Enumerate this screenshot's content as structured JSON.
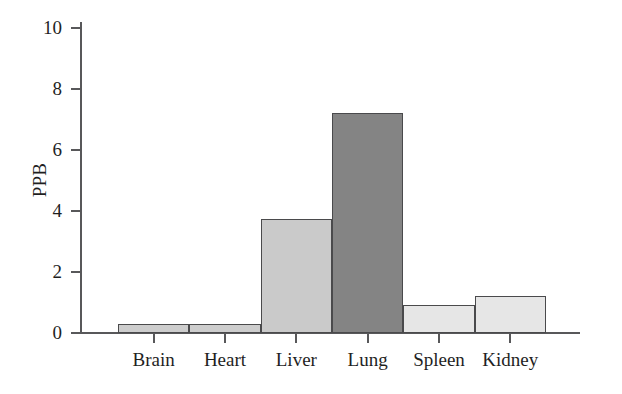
{
  "chart_data": {
    "type": "bar",
    "title": "",
    "subtitle": "",
    "xlabel": "",
    "ylabel": "PPB",
    "categories": [
      "Brain",
      "Heart",
      "Liver",
      "Lung",
      "Spleen",
      "Kidney"
    ],
    "values": [
      0.3,
      0.28,
      3.75,
      7.2,
      0.92,
      1.2
    ],
    "bar_colors": [
      "#cdcdcd",
      "#cdcdcd",
      "#cacaca",
      "#848484",
      "#e6e6e6",
      "#e6e6e6"
    ],
    "bar_edge_color": "#4a4a4c",
    "ylim": [
      0,
      10.2
    ],
    "yticks": [
      0,
      2,
      4,
      6,
      8,
      10
    ],
    "ytick_labels": [
      "0",
      "2",
      "4",
      "6",
      "8",
      "10"
    ],
    "grid": false,
    "legend": null,
    "legend_position": "none",
    "axis_color": "#58585a",
    "bars_contiguous": true
  },
  "axes": {
    "y_axis_title": "PPB"
  }
}
